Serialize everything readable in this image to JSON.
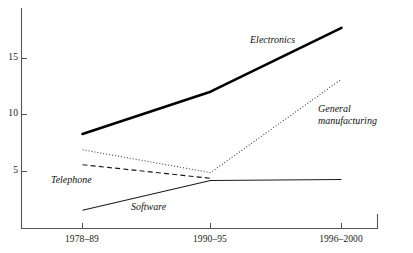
{
  "chart_data": {
    "type": "line",
    "title": "",
    "subtitle": "",
    "xlabel": "",
    "ylabel": "",
    "categories": [
      "1978–89",
      "1990–95",
      "1996–2000"
    ],
    "xtick_labels": [
      "1978–89",
      "1990–95",
      "1996–2000"
    ],
    "ytick_labels": [
      "5",
      "10",
      "15"
    ],
    "ytick_values": [
      5,
      10,
      15
    ],
    "ylim": [
      0,
      19.5
    ],
    "grid": false,
    "legend_position": "inline-annotations",
    "axes": {
      "left_spine": true,
      "bottom_spine": true,
      "top_spine": false,
      "right_spine": false
    },
    "series": [
      {
        "name": "Electronics",
        "label": "Electronics",
        "style": "solid-thick",
        "color": "#000000",
        "width": 2.6,
        "values": [
          8.3,
          12.0,
          17.6
        ]
      },
      {
        "name": "General manufacturing",
        "label": "General manufacturing",
        "label_line1": "General",
        "label_line2": "manufacturing",
        "style": "dotted",
        "color": "#333333",
        "width": 1.0,
        "values": [
          6.9,
          4.9,
          13.1
        ]
      },
      {
        "name": "Telephone",
        "label": "Telephone",
        "style": "dashed",
        "color": "#1a1a1a",
        "width": 1.1,
        "values": [
          5.6,
          4.4,
          null
        ]
      },
      {
        "name": "Software",
        "label": "Software",
        "style": "solid-thin",
        "color": "#1a1a1a",
        "width": 1.0,
        "values": [
          1.6,
          4.2,
          4.3
        ]
      }
    ],
    "annotations": [
      {
        "text": "Electronics",
        "series": "Electronics"
      },
      {
        "text": "General manufacturing",
        "series": "General manufacturing"
      },
      {
        "text": "Telephone",
        "series": "Telephone"
      },
      {
        "text": "Software",
        "series": "Software"
      }
    ]
  },
  "colors": {
    "axis": "#555555",
    "text": "#1a1a1a",
    "background": "#ffffff"
  }
}
